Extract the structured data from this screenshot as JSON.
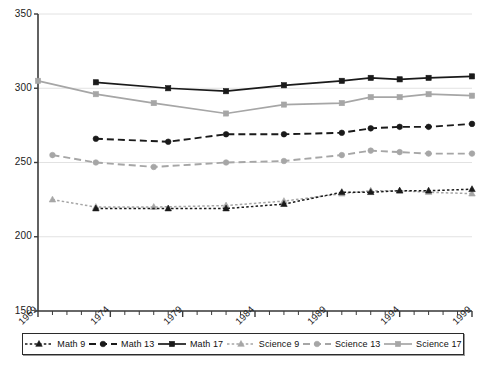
{
  "chart_data": {
    "type": "line",
    "title": "",
    "xlabel": "",
    "ylabel": "",
    "xlim": [
      1969,
      1999
    ],
    "ylim": [
      150,
      350
    ],
    "grid": true,
    "grid_axis": "y",
    "legend_position": "bottom",
    "y_ticks": [
      150,
      200,
      250,
      300,
      350
    ],
    "x_ticks": [
      1969,
      1974,
      1979,
      1984,
      1989,
      1994,
      1999
    ],
    "x_minor_tick_step": 1,
    "series": [
      {
        "name": "Math 9",
        "color": "#1a1a1a",
        "marker": "triangle",
        "dash": "dotted",
        "x": [
          1973,
          1978,
          1982,
          1986,
          1990,
          1992,
          1994,
          1996,
          1999
        ],
        "values": [
          219,
          219,
          219,
          222,
          230,
          230,
          231,
          231,
          232
        ]
      },
      {
        "name": "Math 13",
        "color": "#1a1a1a",
        "marker": "circle",
        "dash": "dashed",
        "x": [
          1973,
          1978,
          1982,
          1986,
          1990,
          1992,
          1994,
          1996,
          1999
        ],
        "values": [
          266,
          264,
          269,
          269,
          270,
          273,
          274,
          274,
          276
        ]
      },
      {
        "name": "Math 17",
        "color": "#1a1a1a",
        "marker": "square",
        "dash": "solid",
        "x": [
          1973,
          1978,
          1982,
          1986,
          1990,
          1992,
          1994,
          1996,
          1999
        ],
        "values": [
          304,
          300,
          298,
          302,
          305,
          307,
          306,
          307,
          308
        ]
      },
      {
        "name": "Science 9",
        "color": "#a6a6a6",
        "marker": "triangle",
        "dash": "dotted",
        "x": [
          1970,
          1973,
          1977,
          1982,
          1986,
          1990,
          1992,
          1994,
          1996,
          1999
        ],
        "values": [
          225,
          220,
          220,
          221,
          224,
          229,
          231,
          231,
          230,
          229
        ]
      },
      {
        "name": "Science 13",
        "color": "#a6a6a6",
        "marker": "circle",
        "dash": "dashed",
        "x": [
          1970,
          1973,
          1977,
          1982,
          1986,
          1990,
          1992,
          1994,
          1996,
          1999
        ],
        "values": [
          255,
          250,
          247,
          250,
          251,
          255,
          258,
          257,
          256,
          256
        ]
      },
      {
        "name": "Science 17",
        "color": "#a6a6a6",
        "marker": "square",
        "dash": "solid",
        "x": [
          1969,
          1973,
          1977,
          1982,
          1986,
          1990,
          1992,
          1994,
          1996,
          1999
        ],
        "values": [
          305,
          296,
          290,
          283,
          289,
          290,
          294,
          294,
          296,
          295
        ]
      }
    ]
  },
  "axis": {
    "y_labels": [
      "350",
      "300",
      "250",
      "200",
      "150"
    ],
    "x_labels": [
      "1969",
      "1974",
      "1979",
      "1984",
      "1989",
      "1994",
      "1999"
    ]
  },
  "legend": {
    "items": [
      {
        "label": "Math 9"
      },
      {
        "label": "Math 13"
      },
      {
        "label": "Math 17"
      },
      {
        "label": "Science 9"
      },
      {
        "label": "Science 13"
      },
      {
        "label": "Science 17"
      }
    ]
  },
  "colors": {
    "math": "#1a1a1a",
    "science": "#a6a6a6",
    "axis": "#3a3a3a",
    "grid": "#e2e2e2",
    "background": "#ffffff"
  }
}
